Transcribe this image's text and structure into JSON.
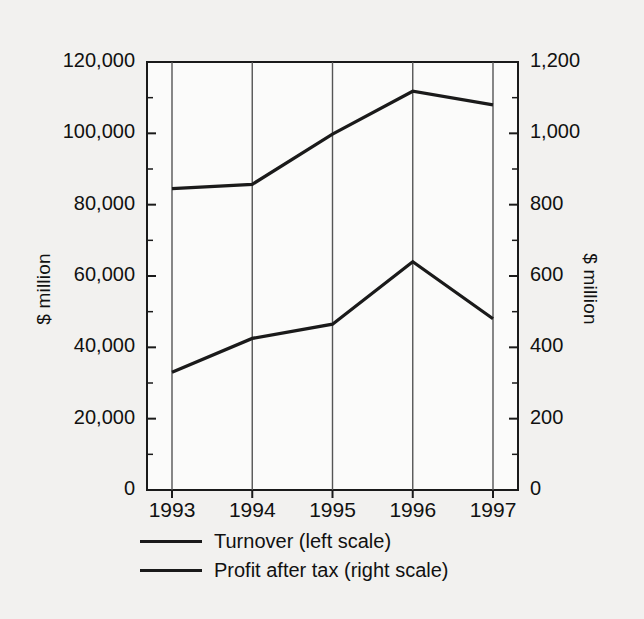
{
  "chart_data": {
    "type": "line",
    "title": "",
    "xlabel": "",
    "ylabel": "$ million",
    "ylabel_right": "$ million",
    "categories": [
      "1993",
      "1994",
      "1995",
      "1996",
      "1997"
    ],
    "x_tick_labels": [
      "1993",
      "1994",
      "1995",
      "1996",
      "1997"
    ],
    "left_axis": {
      "label": "$ million",
      "ylim": [
        0,
        120000
      ],
      "ticks": [
        0,
        20000,
        40000,
        60000,
        80000,
        100000,
        120000
      ],
      "tick_labels": [
        "0",
        "20,000",
        "40,000",
        "60,000",
        "80,000",
        "100,000",
        "120,000"
      ],
      "minor_tick_interval": 10000
    },
    "right_axis": {
      "label": "$ million",
      "ylim": [
        0,
        1200
      ],
      "ticks": [
        0,
        200,
        400,
        600,
        800,
        1000,
        1200
      ],
      "tick_labels": [
        "0",
        "200",
        "400",
        "600",
        "800",
        "1,000",
        "1,200"
      ],
      "minor_tick_interval": 100
    },
    "grid": "vertical-only",
    "legend_position": "below",
    "series": [
      {
        "name": "Turnover (left scale)",
        "axis": "left",
        "color": "#1a1a1a",
        "values": [
          84500,
          85700,
          99800,
          111800,
          108000
        ]
      },
      {
        "name": "Profit after tax (right scale)",
        "axis": "right",
        "color": "#1a1a1a",
        "values": [
          330,
          425,
          465,
          640,
          480
        ]
      }
    ]
  },
  "legend": {
    "items": [
      {
        "label": "Turnover (left scale)"
      },
      {
        "label": "Profit after tax (right scale)"
      }
    ]
  }
}
